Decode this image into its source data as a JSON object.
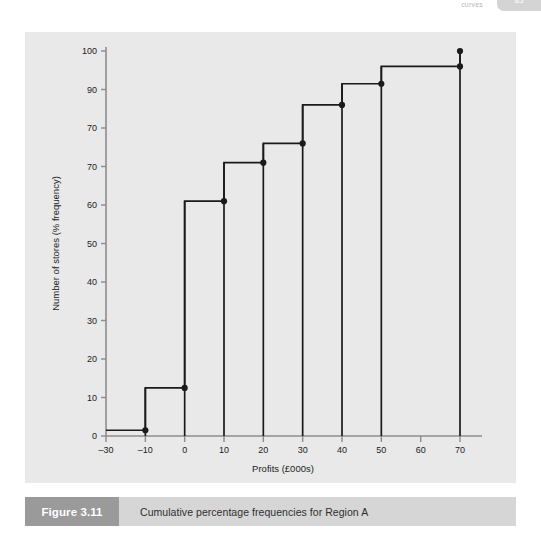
{
  "header": {
    "running_text": "curves",
    "page_number": "85"
  },
  "figure": {
    "number_label": "Figure 3.11",
    "caption": "Cumulative percentage frequencies for Region A"
  },
  "chart_data": {
    "type": "line",
    "subtype": "cumulative-step-ogive",
    "title": "Cumulative percentage frequencies for Region A",
    "xlabel": "Profits (£000s)",
    "ylabel": "Number of stores (% frequency)",
    "xlim": [
      -30,
      75
    ],
    "ylim": [
      0,
      100
    ],
    "grid": false,
    "legend": null,
    "xtick_labels": [
      "–30",
      "–10",
      "0",
      "10",
      "20",
      "30",
      "40",
      "50",
      "60",
      "70"
    ],
    "xtick_values": [
      -30,
      -10,
      0,
      10,
      20,
      30,
      40,
      50,
      60,
      70
    ],
    "ytick_labels": [
      "0",
      "10",
      "20",
      "30",
      "40",
      "50",
      "60",
      "70",
      "70",
      "90",
      "100"
    ],
    "ytick_values": [
      0,
      10,
      20,
      30,
      40,
      50,
      60,
      70,
      80,
      90,
      100
    ],
    "x": [
      -30,
      -10,
      0,
      10,
      20,
      30,
      40,
      50,
      70
    ],
    "values": [
      1.5,
      12.5,
      61,
      71,
      76,
      86,
      91.5,
      96,
      100
    ],
    "points": [
      {
        "x": -30,
        "y": 1.5
      },
      {
        "x": -10,
        "y": 12.5
      },
      {
        "x": 0,
        "y": 61
      },
      {
        "x": 10,
        "y": 71
      },
      {
        "x": 20,
        "y": 76
      },
      {
        "x": 30,
        "y": 86
      },
      {
        "x": 40,
        "y": 91.5
      },
      {
        "x": 50,
        "y": 96
      },
      {
        "x": 70,
        "y": 100
      }
    ],
    "marker": "filled-circle",
    "line_color": "#1a1a1a",
    "panel_color": "#e9e9e9",
    "axis_color": "#8c8c8c"
  }
}
